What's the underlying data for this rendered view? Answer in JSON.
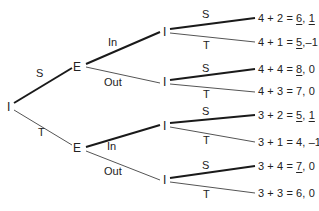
{
  "tree": {
    "root": {
      "label": "I",
      "x": 7,
      "y": 101
    },
    "root_moves": [
      {
        "label": "S",
        "x": 36,
        "y": 68
      },
      {
        "label": "T",
        "x": 38,
        "y": 127
      }
    ],
    "e_nodes": [
      {
        "label": "E",
        "x": 73,
        "y": 61
      },
      {
        "label": "E",
        "x": 73,
        "y": 142
      }
    ],
    "e_moves": [
      {
        "label": "In",
        "x": 108,
        "y": 37
      },
      {
        "label": "Out",
        "x": 104,
        "y": 77
      },
      {
        "label": "In",
        "x": 107,
        "y": 141
      },
      {
        "label": "Out",
        "x": 104,
        "y": 166
      }
    ],
    "i_nodes": [
      {
        "label": "I",
        "x": 163,
        "y": 26
      },
      {
        "label": "I",
        "x": 163,
        "y": 76
      },
      {
        "label": "I",
        "x": 163,
        "y": 120
      },
      {
        "label": "I",
        "x": 163,
        "y": 174
      }
    ],
    "i_moves": [
      {
        "label": "S",
        "x": 202,
        "y": 9
      },
      {
        "label": "T",
        "x": 203,
        "y": 40
      },
      {
        "label": "S",
        "x": 202,
        "y": 63
      },
      {
        "label": "T",
        "x": 203,
        "y": 89
      },
      {
        "label": "S",
        "x": 202,
        "y": 106
      },
      {
        "label": "T",
        "x": 203,
        "y": 135
      },
      {
        "label": "S",
        "x": 202,
        "y": 160
      },
      {
        "label": "T",
        "x": 203,
        "y": 189
      }
    ],
    "payoffs": [
      {
        "expr": "4 + 2 = ",
        "p1": "6",
        "p1_underlined": true,
        "sep": ", ",
        "p2": "1",
        "p2_underlined": true,
        "x": 258,
        "y": 13
      },
      {
        "expr": "4 + 1 = ",
        "p1": "5",
        "p1_underlined": true,
        "sep": ",",
        "p2": "–1",
        "p2_underlined": false,
        "x": 258,
        "y": 37
      },
      {
        "expr": "4 + 4 = ",
        "p1": "8",
        "p1_underlined": true,
        "sep": ", ",
        "p2": "0",
        "p2_underlined": false,
        "x": 258,
        "y": 64
      },
      {
        "expr": "4 + 3 = ",
        "p1": "7",
        "p1_underlined": false,
        "sep": ", ",
        "p2": "0",
        "p2_underlined": false,
        "x": 258,
        "y": 86
      },
      {
        "expr": "3 + 2 = ",
        "p1": "5",
        "p1_underlined": true,
        "sep": ", ",
        "p2": "1",
        "p2_underlined": true,
        "x": 258,
        "y": 110
      },
      {
        "expr": "3 + 1 = ",
        "p1": "4",
        "p1_underlined": false,
        "sep": ", ",
        "p2": "–1",
        "p2_underlined": false,
        "x": 258,
        "y": 137
      },
      {
        "expr": "3 + 4 = ",
        "p1": "7",
        "p1_underlined": true,
        "sep": ", ",
        "p2": "0",
        "p2_underlined": false,
        "x": 258,
        "y": 161
      },
      {
        "expr": "3 + 3 = ",
        "p1": "6",
        "p1_underlined": false,
        "sep": ", ",
        "p2": "0",
        "p2_underlined": false,
        "x": 258,
        "y": 188
      }
    ],
    "colors": {
      "thick_edge": "#1a1a1a",
      "thin_edge": "#555555",
      "text": "#222222"
    }
  }
}
